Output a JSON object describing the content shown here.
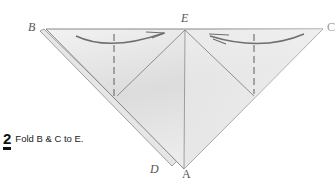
{
  "diagram": {
    "type": "origami-instruction",
    "points": {
      "B": {
        "label": "B",
        "x": 44,
        "y": 29
      },
      "C": {
        "label": "C",
        "x": 323,
        "y": 29
      },
      "E": {
        "label": "E",
        "x": 185,
        "y": 30
      },
      "A": {
        "label": "A",
        "x": 184,
        "y": 170
      },
      "D": {
        "label": "D",
        "x": 172,
        "y": 165
      }
    },
    "colors": {
      "paper": "#ececec",
      "paper_shade": "#d4d4d4",
      "line": "#6b6b6b",
      "dashed": "#6b6b6b",
      "arrow": "#6e6e6e"
    }
  },
  "step": {
    "number": "2",
    "instruction": "Fold B & C to E."
  }
}
